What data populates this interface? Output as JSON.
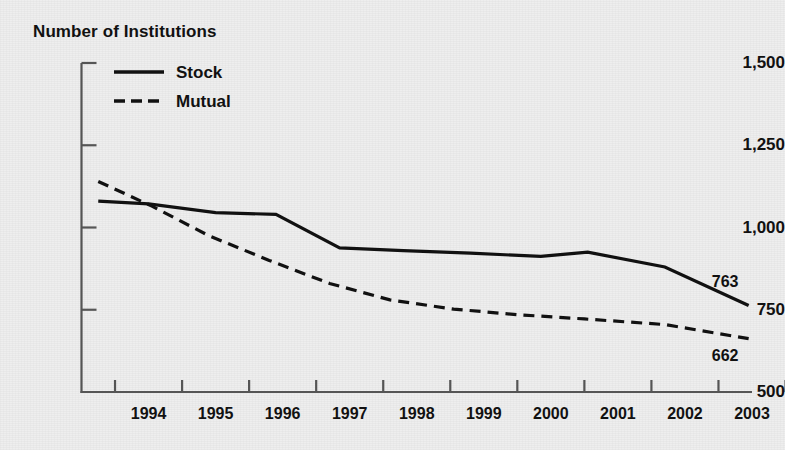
{
  "chart_data": {
    "type": "line",
    "title": "Number of Institutions",
    "xlabel": "",
    "ylabel": "Number of Institutions",
    "ylim": [
      500,
      1500
    ],
    "xlim": [
      1993.5,
      2003.5
    ],
    "grid": false,
    "legend_position": "top-left",
    "y_ticks": [
      "1,500",
      "1,250",
      "1,000",
      "750",
      "500"
    ],
    "y_tick_values": [
      1500,
      1250,
      1000,
      750,
      500
    ],
    "categories": [
      "1994",
      "1995",
      "1996",
      "1997",
      "1998",
      "1999",
      "2000",
      "2001",
      "2002",
      "2003"
    ],
    "x_values": [
      1994,
      1995,
      1996,
      1997,
      1998,
      1999,
      2000,
      2001,
      2002,
      2003
    ],
    "series": [
      {
        "name": "Stock",
        "style": "solid",
        "color": "#111111",
        "values": [
          1080,
          1072,
          1045,
          1040,
          938,
          930,
          922,
          912,
          925,
          880,
          763
        ],
        "x": [
          1993.75,
          1994.5,
          1995.5,
          1996.4,
          1997.35,
          1998.3,
          1999.3,
          2000.35,
          2001.05,
          2002.2,
          2003.45
        ],
        "end_label": "763"
      },
      {
        "name": "Mutual",
        "style": "dashed",
        "color": "#111111",
        "values": [
          1140,
          1065,
          975,
          900,
          830,
          780,
          752,
          735,
          722,
          705,
          662
        ],
        "x": [
          1993.75,
          1994.55,
          1995.4,
          1996.3,
          1997.2,
          1998.1,
          1999.05,
          2000.0,
          2001.0,
          2002.2,
          2003.45
        ],
        "end_label": "662"
      }
    ],
    "annotations": [
      {
        "text": "763",
        "series": "Stock",
        "at_x": 2003.1,
        "at_y": 835
      },
      {
        "text": "662",
        "series": "Mutual",
        "at_x": 2003.1,
        "at_y": 608
      }
    ],
    "axis_color": "#555555",
    "line_color": "#111111",
    "background": "#eeeeee"
  },
  "legend": {
    "items": [
      {
        "label": "Stock",
        "style": "solid"
      },
      {
        "label": "Mutual",
        "style": "dashed"
      }
    ]
  }
}
